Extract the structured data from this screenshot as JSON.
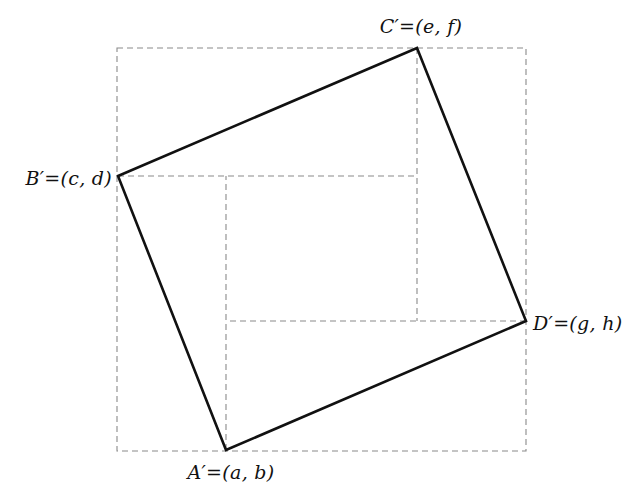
{
  "figure": {
    "background_color": "#ffffff",
    "solid_stroke_color": "#111111",
    "solid_stroke_width": 2.6,
    "dashed_stroke_color": "#8a8a8a",
    "dashed_stroke_width": 1.1,
    "dash_pattern": "6,4",
    "label_color": "#111111",
    "label_font_size": "19px"
  },
  "labels": {
    "a_prime": "A′=(a,  b)",
    "b_prime": "B′=(c,  d)",
    "c_prime": "C′=(e,  f)",
    "d_prime": "D′=(g,  h)"
  },
  "chart_data": {
    "type": "scatter",
    "xlabel": "",
    "ylabel": "",
    "xlim": [
      0,
      637
    ],
    "ylim": [
      500,
      0
    ],
    "grid": false,
    "legend": false,
    "points": [
      {
        "name": "A'",
        "label": "A′=(a,  b)",
        "x": 226,
        "y": 450,
        "label_x": 231,
        "label_y": 472,
        "label_anchor": "center"
      },
      {
        "name": "B'",
        "label": "B′=(c,  d)",
        "x": 118,
        "y": 176,
        "label_x": 112,
        "label_y": 178,
        "label_anchor": "right"
      },
      {
        "name": "C'",
        "label": "C′=(e,  f)",
        "x": 417,
        "y": 48,
        "label_x": 421,
        "label_y": 26,
        "label_anchor": "center"
      },
      {
        "name": "D'",
        "label": "D′=(g,  h)",
        "x": 526,
        "y": 321,
        "label_x": 533,
        "label_y": 323,
        "label_anchor": "left"
      }
    ],
    "quadrilateral": {
      "name": "A'B'C'D'",
      "style": "solid",
      "closed": true,
      "vertices": [
        [
          226,
          450
        ],
        [
          118,
          176
        ],
        [
          417,
          48
        ],
        [
          526,
          321
        ]
      ]
    },
    "bounding_square": {
      "name": "outer-dashed-square",
      "style": "dashed",
      "x_min": 117,
      "y_min": 48,
      "x_max": 526,
      "y_max": 451,
      "width": 409,
      "height": 403
    },
    "inner_rectangle": {
      "name": "inner-dashed-rectangle",
      "style": "dashed",
      "x_min": 226,
      "y_min": 176,
      "x_max": 417,
      "y_max": 321,
      "width": 191,
      "height": 145
    },
    "projection_segments": [
      {
        "name": "b-horizontal",
        "from": [
          118,
          176
        ],
        "to": [
          417,
          176
        ],
        "style": "dashed"
      },
      {
        "name": "a-vertical",
        "from": [
          226,
          450
        ],
        "to": [
          226,
          176
        ],
        "style": "dashed"
      },
      {
        "name": "c-vertical",
        "from": [
          417,
          48
        ],
        "to": [
          417,
          321
        ],
        "style": "dashed"
      },
      {
        "name": "d-horizontal",
        "from": [
          526,
          321
        ],
        "to": [
          226,
          321
        ],
        "style": "dashed"
      }
    ]
  }
}
